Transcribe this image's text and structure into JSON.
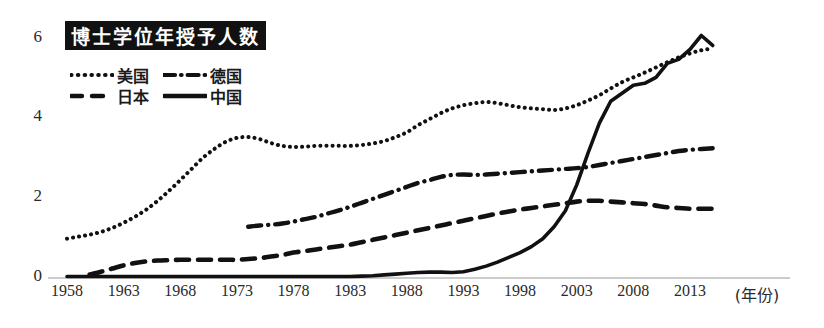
{
  "title": "博士学位年授予人数",
  "axes": {
    "y_ticks": [
      "0",
      "2",
      "4",
      "6"
    ],
    "x_ticks": [
      "1958",
      "1963",
      "1968",
      "1973",
      "1978",
      "1983",
      "1988",
      "1993",
      "1998",
      "2003",
      "2008",
      "2013"
    ],
    "x_axis_label": "(年份)"
  },
  "legend": {
    "items": [
      {
        "label": "美国",
        "style": "dotted"
      },
      {
        "label": "德国",
        "style": "dash-dot"
      },
      {
        "label": "日本",
        "style": "dashed"
      },
      {
        "label": "中国",
        "style": "solid"
      }
    ]
  },
  "colors": {
    "ink": "#111111",
    "axis": "#2a2a2a",
    "title_bg": "#111111",
    "title_fg": "#ffffff"
  },
  "chart_data": {
    "type": "line",
    "title": "博士学位年授予人数",
    "xlabel": "(年份)",
    "ylabel": "",
    "xlim": [
      1958,
      2015
    ],
    "ylim": [
      0,
      6.3
    ],
    "yticks": [
      0,
      2,
      4,
      6
    ],
    "xticks": [
      1958,
      1963,
      1968,
      1973,
      1978,
      1983,
      1988,
      1993,
      1998,
      2003,
      2008,
      2013
    ],
    "grid": false,
    "legend_position": "top-left",
    "series": [
      {
        "name": "美国",
        "style": "dotted",
        "x": [
          1958,
          1959,
          1960,
          1961,
          1962,
          1963,
          1964,
          1965,
          1966,
          1967,
          1968,
          1969,
          1970,
          1971,
          1972,
          1973,
          1974,
          1975,
          1976,
          1977,
          1978,
          1979,
          1980,
          1981,
          1982,
          1983,
          1984,
          1985,
          1986,
          1987,
          1988,
          1989,
          1990,
          1991,
          1992,
          1993,
          1994,
          1995,
          1996,
          1997,
          1998,
          1999,
          2000,
          2001,
          2002,
          2003,
          2004,
          2005,
          2006,
          2007,
          2008,
          2009,
          2010,
          2011,
          2012,
          2013,
          2014,
          2015
        ],
        "y": [
          0.95,
          1.0,
          1.05,
          1.12,
          1.22,
          1.35,
          1.5,
          1.68,
          1.9,
          2.15,
          2.42,
          2.7,
          2.98,
          3.2,
          3.38,
          3.48,
          3.5,
          3.45,
          3.35,
          3.28,
          3.25,
          3.26,
          3.28,
          3.28,
          3.28,
          3.28,
          3.3,
          3.34,
          3.4,
          3.5,
          3.62,
          3.8,
          3.95,
          4.1,
          4.22,
          4.3,
          4.35,
          4.38,
          4.35,
          4.3,
          4.25,
          4.22,
          4.2,
          4.18,
          4.22,
          4.3,
          4.42,
          4.55,
          4.72,
          4.88,
          5.0,
          5.12,
          5.25,
          5.38,
          5.5,
          5.6,
          5.68,
          5.72
        ]
      },
      {
        "name": "德国",
        "style": "dash-dot",
        "x": [
          1974,
          1975,
          1976,
          1977,
          1978,
          1979,
          1980,
          1981,
          1982,
          1983,
          1984,
          1985,
          1986,
          1987,
          1988,
          1989,
          1990,
          1991,
          1992,
          1993,
          1994,
          1995,
          1996,
          1997,
          1998,
          1999,
          2000,
          2001,
          2002,
          2003,
          2004,
          2005,
          2006,
          2007,
          2008,
          2009,
          2010,
          2011,
          2012,
          2013,
          2014,
          2015
        ],
        "y": [
          1.25,
          1.28,
          1.3,
          1.33,
          1.38,
          1.44,
          1.5,
          1.58,
          1.66,
          1.75,
          1.85,
          1.95,
          2.05,
          2.15,
          2.25,
          2.35,
          2.42,
          2.5,
          2.55,
          2.56,
          2.55,
          2.56,
          2.58,
          2.6,
          2.62,
          2.64,
          2.66,
          2.68,
          2.7,
          2.72,
          2.75,
          2.8,
          2.85,
          2.9,
          2.95,
          3.0,
          3.05,
          3.1,
          3.15,
          3.18,
          3.2,
          3.22
        ]
      },
      {
        "name": "日本",
        "style": "dashed",
        "x": [
          1960,
          1961,
          1962,
          1963,
          1964,
          1965,
          1966,
          1967,
          1968,
          1969,
          1970,
          1971,
          1972,
          1973,
          1974,
          1975,
          1976,
          1977,
          1978,
          1979,
          1980,
          1981,
          1982,
          1983,
          1984,
          1985,
          1986,
          1987,
          1988,
          1989,
          1990,
          1991,
          1992,
          1993,
          1994,
          1995,
          1996,
          1997,
          1998,
          1999,
          2000,
          2001,
          2002,
          2003,
          2004,
          2005,
          2006,
          2007,
          2008,
          2009,
          2010,
          2011,
          2012,
          2013,
          2014,
          2015
        ],
        "y": [
          0.05,
          0.12,
          0.2,
          0.28,
          0.34,
          0.38,
          0.4,
          0.41,
          0.42,
          0.42,
          0.42,
          0.42,
          0.42,
          0.42,
          0.44,
          0.46,
          0.5,
          0.54,
          0.6,
          0.64,
          0.68,
          0.72,
          0.76,
          0.8,
          0.86,
          0.92,
          0.98,
          1.04,
          1.1,
          1.16,
          1.22,
          1.28,
          1.34,
          1.4,
          1.46,
          1.52,
          1.58,
          1.63,
          1.68,
          1.72,
          1.76,
          1.8,
          1.84,
          1.88,
          1.9,
          1.9,
          1.88,
          1.86,
          1.84,
          1.82,
          1.78,
          1.74,
          1.72,
          1.7,
          1.7,
          1.7
        ]
      },
      {
        "name": "中国",
        "style": "solid",
        "x": [
          1958,
          1963,
          1968,
          1973,
          1978,
          1983,
          1984,
          1985,
          1986,
          1987,
          1988,
          1989,
          1990,
          1991,
          1992,
          1993,
          1994,
          1995,
          1996,
          1997,
          1998,
          1999,
          2000,
          2001,
          2002,
          2003,
          2004,
          2005,
          2006,
          2007,
          2008,
          2009,
          2010,
          2011,
          2012,
          2013,
          2014,
          2015
        ],
        "y": [
          0.0,
          0.0,
          0.0,
          0.0,
          0.0,
          0.0,
          0.01,
          0.02,
          0.04,
          0.06,
          0.08,
          0.1,
          0.11,
          0.11,
          0.1,
          0.12,
          0.18,
          0.26,
          0.36,
          0.48,
          0.6,
          0.75,
          0.95,
          1.25,
          1.65,
          2.3,
          3.1,
          3.85,
          4.4,
          4.6,
          4.8,
          4.85,
          5.0,
          5.35,
          5.45,
          5.7,
          6.05,
          5.8
        ]
      }
    ]
  }
}
